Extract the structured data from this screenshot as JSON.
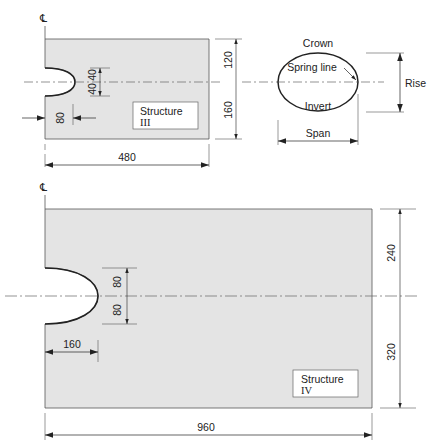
{
  "colors": {
    "fill": "#e4e4e4",
    "stroke": "#333333",
    "line": "#555555",
    "background": "#ffffff"
  },
  "centerline_symbol": "℄",
  "structure_iii": {
    "label_line1": "Structure",
    "label_line2": "III",
    "dims": {
      "top_half": "120",
      "bottom_half": "160",
      "notch_upper": "40",
      "notch_lower": "40",
      "notch_depth": "80",
      "width": "480"
    }
  },
  "culvert_section": {
    "crown": "Crown",
    "spring_line": "Spring line",
    "invert": "Invert",
    "rise": "Rise",
    "span": "Span"
  },
  "structure_iv": {
    "label_line1": "Structure",
    "label_line2": "IV",
    "dims": {
      "top_half": "240",
      "bottom_half": "320",
      "notch_upper": "80",
      "notch_lower": "80",
      "notch_depth": "160",
      "width": "960"
    }
  }
}
